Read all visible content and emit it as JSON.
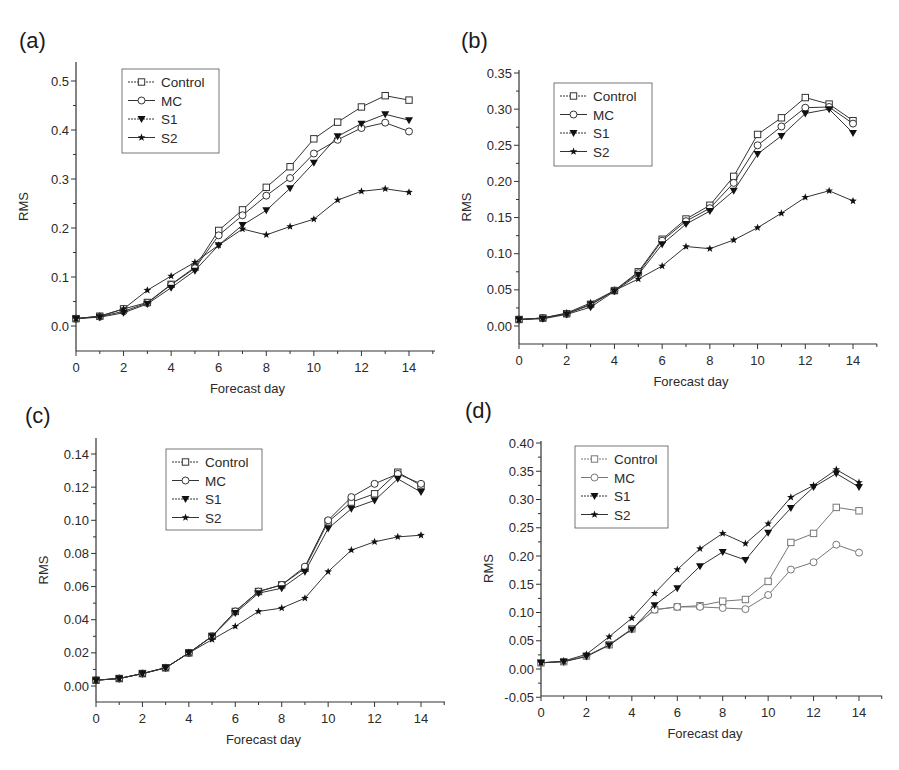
{
  "chart_data": [
    {
      "panel": "(a)",
      "type": "line",
      "title": "",
      "xlabel": "Forecast day",
      "ylabel": "RMS",
      "x": [
        0,
        1,
        2,
        3,
        4,
        5,
        6,
        7,
        8,
        9,
        10,
        11,
        12,
        13,
        14
      ],
      "xticks": [
        0,
        2,
        4,
        6,
        8,
        10,
        12,
        14
      ],
      "yticks": [
        "0.0",
        "0.1",
        "0.2",
        "0.3",
        "0.4",
        "0.5"
      ],
      "ylim": [
        -0.05,
        0.5
      ],
      "legend_position": "upper left",
      "grid": false,
      "series": [
        {
          "name": "Control",
          "marker": "open-square",
          "values": [
            0.015,
            0.02,
            0.035,
            0.048,
            0.085,
            0.12,
            0.195,
            0.237,
            0.283,
            0.325,
            0.382,
            0.416,
            0.447,
            0.47,
            0.461
          ]
        },
        {
          "name": "MC",
          "marker": "open-circle",
          "values": [
            0.015,
            0.019,
            0.03,
            0.047,
            0.084,
            0.118,
            0.185,
            0.226,
            0.266,
            0.302,
            0.352,
            0.38,
            0.404,
            0.415,
            0.397
          ]
        },
        {
          "name": "S1",
          "marker": "filled-triangle-down",
          "values": [
            0.015,
            0.018,
            0.027,
            0.045,
            0.078,
            0.113,
            0.165,
            0.206,
            0.236,
            0.281,
            0.333,
            0.387,
            0.413,
            0.432,
            0.42
          ]
        },
        {
          "name": "S2",
          "marker": "filled-star",
          "values": [
            0.015,
            0.02,
            0.035,
            0.073,
            0.102,
            0.13,
            0.165,
            0.198,
            0.186,
            0.203,
            0.218,
            0.257,
            0.275,
            0.28,
            0.273
          ]
        }
      ]
    },
    {
      "panel": "(b)",
      "type": "line",
      "title": "",
      "xlabel": "Forecast day",
      "ylabel": "RMS",
      "x": [
        0,
        1,
        2,
        3,
        4,
        5,
        6,
        7,
        8,
        9,
        10,
        11,
        12,
        13,
        14
      ],
      "xticks": [
        0,
        2,
        4,
        6,
        8,
        10,
        12,
        14
      ],
      "yticks": [
        "0.00",
        "0.05",
        "0.10",
        "0.15",
        "0.20",
        "0.25",
        "0.30",
        "0.35"
      ],
      "ylim": [
        -0.025,
        0.35
      ],
      "legend_position": "upper left",
      "grid": false,
      "series": [
        {
          "name": "Control",
          "marker": "open-square",
          "values": [
            0.009,
            0.011,
            0.017,
            0.03,
            0.049,
            0.075,
            0.12,
            0.148,
            0.167,
            0.207,
            0.265,
            0.288,
            0.316,
            0.307,
            0.284
          ]
        },
        {
          "name": "MC",
          "marker": "open-circle",
          "values": [
            0.009,
            0.011,
            0.017,
            0.029,
            0.049,
            0.073,
            0.118,
            0.145,
            0.163,
            0.198,
            0.25,
            0.276,
            0.302,
            0.303,
            0.28
          ]
        },
        {
          "name": "S1",
          "marker": "filled-triangle-down",
          "values": [
            0.009,
            0.01,
            0.016,
            0.026,
            0.048,
            0.071,
            0.113,
            0.141,
            0.159,
            0.187,
            0.238,
            0.263,
            0.294,
            0.3,
            0.267
          ]
        },
        {
          "name": "S2",
          "marker": "filled-star",
          "values": [
            0.009,
            0.011,
            0.018,
            0.032,
            0.049,
            0.065,
            0.083,
            0.11,
            0.107,
            0.119,
            0.136,
            0.156,
            0.178,
            0.187,
            0.173
          ]
        }
      ]
    },
    {
      "panel": "(c)",
      "type": "line",
      "title": "",
      "xlabel": "Forecast day",
      "ylabel": "RMS",
      "x": [
        0,
        1,
        2,
        3,
        4,
        5,
        6,
        7,
        8,
        9,
        10,
        11,
        12,
        13,
        14
      ],
      "xticks": [
        0,
        2,
        4,
        6,
        8,
        10,
        12,
        14
      ],
      "yticks": [
        "0.00",
        "0.02",
        "0.04",
        "0.06",
        "0.08",
        "0.10",
        "0.12",
        "0.14"
      ],
      "ylim": [
        -0.01,
        0.15
      ],
      "legend_position": "upper center",
      "grid": false,
      "series": [
        {
          "name": "Control",
          "marker": "open-square",
          "values": [
            0.0035,
            0.0045,
            0.0075,
            0.011,
            0.02,
            0.03,
            0.045,
            0.057,
            0.061,
            0.071,
            0.099,
            0.111,
            0.116,
            0.129,
            0.121
          ]
        },
        {
          "name": "MC",
          "marker": "open-circle",
          "values": [
            0.0035,
            0.0045,
            0.0075,
            0.011,
            0.02,
            0.03,
            0.045,
            0.057,
            0.061,
            0.072,
            0.1,
            0.114,
            0.122,
            0.128,
            0.122
          ]
        },
        {
          "name": "S1",
          "marker": "filled-triangle-down",
          "values": [
            0.0035,
            0.0045,
            0.0075,
            0.011,
            0.02,
            0.03,
            0.044,
            0.056,
            0.059,
            0.069,
            0.095,
            0.107,
            0.112,
            0.125,
            0.117
          ]
        },
        {
          "name": "S2",
          "marker": "filled-star",
          "values": [
            0.0035,
            0.0045,
            0.0075,
            0.011,
            0.02,
            0.028,
            0.036,
            0.045,
            0.047,
            0.053,
            0.069,
            0.082,
            0.087,
            0.09,
            0.091
          ]
        }
      ]
    },
    {
      "panel": "(d)",
      "type": "line",
      "title": "",
      "xlabel": "Forecast day",
      "ylabel": "RMS",
      "x": [
        0,
        1,
        2,
        3,
        4,
        5,
        6,
        7,
        8,
        9,
        10,
        11,
        12,
        13,
        14
      ],
      "xticks": [
        0,
        2,
        4,
        6,
        8,
        10,
        12,
        14
      ],
      "yticks": [
        "-0.05",
        "0.00",
        "0.05",
        "0.10",
        "0.15",
        "0.20",
        "0.25",
        "0.30",
        "0.35",
        "0.40"
      ],
      "ylim": [
        -0.05,
        0.4
      ],
      "legend_position": "upper left",
      "grid": false,
      "series": [
        {
          "name": "Control",
          "marker": "open-square",
          "values": [
            0.011,
            0.013,
            0.023,
            0.043,
            0.071,
            0.105,
            0.11,
            0.112,
            0.12,
            0.123,
            0.155,
            0.224,
            0.24,
            0.286,
            0.28
          ]
        },
        {
          "name": "MC",
          "marker": "open-circle",
          "values": [
            0.011,
            0.013,
            0.023,
            0.043,
            0.071,
            0.105,
            0.11,
            0.11,
            0.108,
            0.106,
            0.131,
            0.176,
            0.189,
            0.22,
            0.206
          ]
        },
        {
          "name": "S1",
          "marker": "filled-triangle-down",
          "values": [
            0.011,
            0.013,
            0.022,
            0.042,
            0.07,
            0.113,
            0.143,
            0.182,
            0.207,
            0.193,
            0.241,
            0.285,
            0.322,
            0.346,
            0.322
          ]
        },
        {
          "name": "S2",
          "marker": "filled-star",
          "values": [
            0.011,
            0.014,
            0.026,
            0.057,
            0.09,
            0.134,
            0.176,
            0.213,
            0.24,
            0.222,
            0.257,
            0.304,
            0.325,
            0.353,
            0.33
          ]
        }
      ]
    }
  ],
  "panels": [
    {
      "label": "(a)"
    },
    {
      "label": "(b)"
    },
    {
      "label": "(c)"
    },
    {
      "label": "(d)"
    }
  ],
  "colors": {
    "line": "#333333",
    "axis": "#333333",
    "open_marker_fill": "#ffffff",
    "legend_border": "#555555",
    "control_line_d": "#777777",
    "mc_line_d": "#777777"
  }
}
